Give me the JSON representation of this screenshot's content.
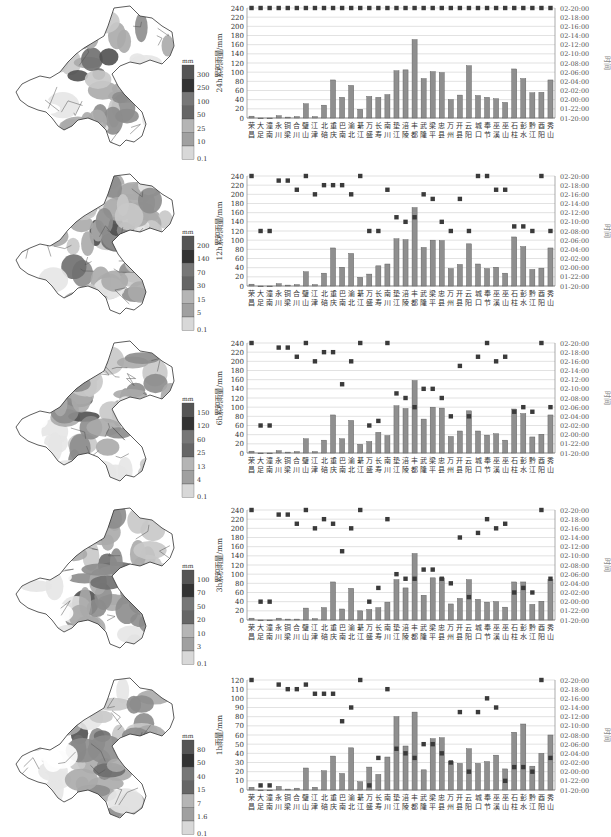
{
  "stations": [
    "荣昌",
    "大足",
    "潼南",
    "永川",
    "铜梁",
    "合川",
    "璧山",
    "江津",
    "北碚",
    "重庆",
    "巴南",
    "渝北",
    "綦江",
    "万盛",
    "长寿",
    "南川",
    "垫江",
    "涪陵",
    "丰都",
    "武隆",
    "梁平",
    "忠县",
    "万州",
    "开县",
    "云阳",
    "城口",
    "奉节",
    "巫溪",
    "巫山",
    "石柱",
    "彭水",
    "黔江",
    "酉阳",
    "秀山"
  ],
  "time_axis": {
    "label": "时间",
    "ticks": [
      "01-20:00",
      "01-22:00",
      "02-00:00",
      "02-02:00",
      "02-04:00",
      "02-06:00",
      "02-08:00",
      "02-10:00",
      "02-12:00",
      "02-14:00",
      "02-16:00",
      "02-18:00",
      "02-20:00"
    ]
  },
  "panels": [
    {
      "id": "24h",
      "legend": {
        "unit": "mm",
        "labels": [
          "300",
          "250",
          "100",
          "50",
          "25",
          "10",
          "0.1"
        ]
      },
      "chart": {
        "ylabel": "24h累积雨量/mm",
        "ymax": 240,
        "yticks": [
          0,
          20,
          40,
          60,
          80,
          100,
          120,
          140,
          160,
          180,
          200,
          220,
          240
        ]
      }
    },
    {
      "id": "12h",
      "legend": {
        "unit": "mm",
        "labels": [
          "200",
          "140",
          "70",
          "30",
          "15",
          "5",
          "0.1"
        ]
      },
      "chart": {
        "ylabel": "12h累积雨量/mm",
        "ymax": 240,
        "yticks": [
          0,
          20,
          40,
          60,
          80,
          100,
          120,
          140,
          160,
          180,
          200,
          220,
          240
        ]
      }
    },
    {
      "id": "6h",
      "legend": {
        "unit": "mm",
        "labels": [
          "150",
          "120",
          "60",
          "25",
          "13",
          "4",
          "0.1"
        ]
      },
      "chart": {
        "ylabel": "6h累积雨量/mm",
        "ymax": 240,
        "yticks": [
          0,
          20,
          40,
          60,
          80,
          100,
          120,
          140,
          160,
          180,
          200,
          220,
          240
        ]
      }
    },
    {
      "id": "3h",
      "legend": {
        "unit": "mm",
        "labels": [
          "100",
          "70",
          "50",
          "20",
          "10",
          "3",
          "0.1"
        ]
      },
      "chart": {
        "ylabel": "3h累积雨量/mm",
        "ymax": 240,
        "yticks": [
          0,
          20,
          40,
          60,
          80,
          100,
          120,
          140,
          160,
          180,
          200,
          220,
          240
        ]
      }
    },
    {
      "id": "1h",
      "legend": {
        "unit": "mm",
        "labels": [
          "80",
          "50",
          "40",
          "15",
          "7",
          "1.6",
          "0.1"
        ]
      },
      "chart": {
        "ylabel": "1h雨量/mm",
        "ymax": 120,
        "yticks": [
          0,
          10,
          20,
          30,
          40,
          50,
          60,
          70,
          80,
          90,
          100,
          110,
          120
        ]
      }
    }
  ],
  "chart_data": [
    {
      "type": "bar",
      "title": "24h累积雨量",
      "ylabel": "24h累积雨量/mm",
      "y2label": "时间",
      "ylim": [
        0,
        240
      ],
      "categories": [
        "荣昌",
        "大足",
        "潼南",
        "永川",
        "铜梁",
        "合川",
        "璧山",
        "江津",
        "北碚",
        "重庆",
        "巴南",
        "渝北",
        "綦江",
        "万盛",
        "长寿",
        "南川",
        "垫江",
        "涪陵",
        "丰都",
        "武隆",
        "梁平",
        "忠县",
        "万州",
        "开县",
        "云阳",
        "城口",
        "奉节",
        "巫溪",
        "巫山",
        "石柱",
        "彭水",
        "黔江",
        "酉阳",
        "秀山"
      ],
      "series": [
        {
          "name": "累积雨量",
          "type": "bar",
          "values": [
            4,
            0,
            0,
            5,
            2,
            3,
            31,
            3,
            28,
            83,
            45,
            71,
            19,
            47,
            45,
            51,
            103,
            105,
            171,
            86,
            101,
            99,
            40,
            50,
            114,
            49,
            45,
            42,
            34,
            107,
            86,
            55,
            56,
            83
          ]
        },
        {
          "name": "出现时间",
          "type": "scatter",
          "axis": "right",
          "values": [
            "02-20:00",
            "02-20:00",
            "02-20:00",
            "02-20:00",
            "02-20:00",
            "02-20:00",
            "02-20:00",
            "02-20:00",
            "02-20:00",
            "02-20:00",
            "02-20:00",
            "02-20:00",
            "02-20:00",
            "02-20:00",
            "02-20:00",
            "02-20:00",
            "02-20:00",
            "02-20:00",
            "02-20:00",
            "02-20:00",
            "02-20:00",
            "02-20:00",
            "02-20:00",
            "02-20:00",
            "02-20:00",
            "02-20:00",
            "02-20:00",
            "02-20:00",
            "02-20:00",
            "02-20:00",
            "02-20:00",
            "02-20:00",
            "02-20:00",
            "02-20:00"
          ]
        }
      ],
      "grid": true
    },
    {
      "type": "bar",
      "title": "12h累积雨量",
      "ylabel": "12h累积雨量/mm",
      "y2label": "时间",
      "ylim": [
        0,
        240
      ],
      "categories": [
        "荣昌",
        "大足",
        "潼南",
        "永川",
        "铜梁",
        "合川",
        "璧山",
        "江津",
        "北碚",
        "重庆",
        "巴南",
        "渝北",
        "綦江",
        "万盛",
        "长寿",
        "南川",
        "垫江",
        "涪陵",
        "丰都",
        "武隆",
        "梁平",
        "忠县",
        "万州",
        "开县",
        "云阳",
        "城口",
        "奉节",
        "巫溪",
        "巫山",
        "石柱",
        "彭水",
        "黔江",
        "酉阳",
        "秀山"
      ],
      "series": [
        {
          "name": "累积雨量",
          "type": "bar",
          "values": [
            4,
            0,
            0,
            5,
            2,
            3,
            31,
            3,
            28,
            83,
            41,
            71,
            19,
            26,
            44,
            48,
            103,
            101,
            171,
            84,
            100,
            99,
            38,
            47,
            92,
            48,
            38,
            41,
            28,
            107,
            86,
            36,
            39,
            83
          ]
        },
        {
          "name": "出现时间",
          "type": "scatter",
          "axis": "right",
          "values": [
            "02-20:00",
            "02-08:00",
            "02-08:00",
            "02-19:00",
            "02-19:00",
            "02-17:00",
            "02-20:00",
            "02-16:00",
            "02-18:00",
            "02-18:00",
            "02-18:00",
            "02-16:00",
            "02-20:00",
            "02-08:00",
            "02-08:00",
            "02-17:00",
            "02-11:00",
            "02-10:00",
            "02-11:00",
            "02-16:00",
            "02-15:00",
            "02-10:00",
            "02-08:00",
            "02-15:00",
            "02-08:00",
            "02-20:00",
            "02-20:00",
            "02-17:00",
            "02-17:00",
            "02-09:00",
            "02-09:00",
            "02-08:00",
            "02-20:00",
            "02-08:00"
          ]
        }
      ],
      "grid": true
    },
    {
      "type": "bar",
      "title": "6h累积雨量",
      "ylabel": "6h累积雨量/mm",
      "y2label": "时间",
      "ylim": [
        0,
        240
      ],
      "categories": [
        "荣昌",
        "大足",
        "潼南",
        "永川",
        "铜梁",
        "合川",
        "璧山",
        "江津",
        "北碚",
        "重庆",
        "巴南",
        "渝北",
        "綦江",
        "万盛",
        "长寿",
        "南川",
        "垫江",
        "涪陵",
        "丰都",
        "武隆",
        "梁平",
        "忠县",
        "万州",
        "开县",
        "云阳",
        "城口",
        "奉节",
        "巫溪",
        "巫山",
        "石柱",
        "彭水",
        "黔江",
        "酉阳",
        "秀山"
      ],
      "series": [
        {
          "name": "累积雨量",
          "type": "bar",
          "values": [
            4,
            0,
            0,
            5,
            2,
            3,
            31,
            3,
            28,
            83,
            31,
            71,
            19,
            25,
            45,
            38,
            103,
            97,
            158,
            74,
            100,
            98,
            36,
            48,
            92,
            48,
            39,
            42,
            28,
            96,
            86,
            35,
            41,
            83
          ]
        },
        {
          "name": "出现时间",
          "type": "scatter",
          "axis": "right",
          "values": [
            "02-20:00",
            "02-02:00",
            "02-02:00",
            "02-19:00",
            "02-19:00",
            "02-17:00",
            "02-20:00",
            "02-16:00",
            "02-18:00",
            "02-18:00",
            "02-11:00",
            "02-16:00",
            "02-20:00",
            "02-02:00",
            "02-03:00",
            "02-20:00",
            "02-09:00",
            "02-08:00",
            "02-06:00",
            "02-10:00",
            "02-10:00",
            "02-08:00",
            "02-04:00",
            "02-15:00",
            "02-04:00",
            "02-17:00",
            "02-20:00",
            "02-16:00",
            "02-17:00",
            "02-05:00",
            "02-06:00",
            "02-05:00",
            "02-20:00",
            "02-06:00"
          ]
        }
      ],
      "grid": true
    },
    {
      "type": "bar",
      "title": "3h累积雨量",
      "ylabel": "3h累积雨量/mm",
      "y2label": "时间",
      "ylim": [
        0,
        240
      ],
      "categories": [
        "荣昌",
        "大足",
        "潼南",
        "永川",
        "铜梁",
        "合川",
        "璧山",
        "江津",
        "北碚",
        "重庆",
        "巴南",
        "渝北",
        "綦江",
        "万盛",
        "长寿",
        "南川",
        "垫江",
        "涪陵",
        "丰都",
        "武隆",
        "梁平",
        "忠县",
        "万州",
        "开县",
        "云阳",
        "城口",
        "奉节",
        "巫溪",
        "巫山",
        "石柱",
        "彭水",
        "黔江",
        "酉阳",
        "秀山"
      ],
      "series": [
        {
          "name": "累积雨量",
          "type": "bar",
          "values": [
            4,
            0,
            0,
            4,
            2,
            2,
            26,
            3,
            27,
            83,
            24,
            69,
            20,
            23,
            27,
            39,
            88,
            70,
            145,
            54,
            92,
            92,
            35,
            47,
            88,
            45,
            39,
            40,
            28,
            83,
            83,
            34,
            41,
            88
          ]
        },
        {
          "name": "出现时间",
          "type": "scatter",
          "axis": "right",
          "values": [
            "02-20:00",
            "02-00:00",
            "02-00:00",
            "02-19:00",
            "02-19:00",
            "02-17:00",
            "02-20:00",
            "02-16:00",
            "02-18:00",
            "02-17:00",
            "02-11:00",
            "02-16:00",
            "02-20:00",
            "02-00:00",
            "02-03:00",
            "02-18:00",
            "02-06:00",
            "02-05:00",
            "02-05:00",
            "02-07:00",
            "02-07:00",
            "02-05:00",
            "02-04:00",
            "02-14:00",
            "02-01:00",
            "02-15:00",
            "02-18:00",
            "02-16:00",
            "02-17:00",
            "02-02:00",
            "02-03:00",
            "02-02:00",
            "02-20:00",
            "02-05:00"
          ]
        }
      ],
      "grid": true
    },
    {
      "type": "bar",
      "title": "1h雨量",
      "ylabel": "1h雨量/mm",
      "y2label": "时间",
      "ylim": [
        0,
        120
      ],
      "categories": [
        "荣昌",
        "大足",
        "潼南",
        "永川",
        "铜梁",
        "合川",
        "璧山",
        "江津",
        "北碚",
        "重庆",
        "巴南",
        "渝北",
        "綦江",
        "万盛",
        "长寿",
        "南川",
        "垫江",
        "涪陵",
        "丰都",
        "武隆",
        "梁平",
        "忠县",
        "万州",
        "开县",
        "云阳",
        "城口",
        "奉节",
        "巫溪",
        "巫山",
        "石柱",
        "彭水",
        "黔江",
        "酉阳",
        "秀山"
      ],
      "series": [
        {
          "name": "雨量",
          "type": "bar",
          "values": [
            3,
            0,
            0,
            4,
            1,
            2,
            24,
            3,
            21,
            37,
            18,
            46,
            9,
            25,
            17,
            36,
            80,
            48,
            85,
            22,
            56,
            57,
            31,
            29,
            45,
            29,
            31,
            38,
            23,
            63,
            72,
            26,
            40,
            60
          ]
        },
        {
          "name": "出现时间",
          "type": "scatter",
          "axis": "right",
          "values": [
            "02-20:00",
            "01-21:00",
            "01-21:00",
            "02-19:00",
            "02-18:00",
            "02-18:00",
            "02-19:00",
            "02-17:00",
            "02-17:00",
            "02-17:00",
            "02-11:00",
            "02-14:00",
            "02-20:00",
            "01-21:00",
            "02-03:00",
            "02-18:00",
            "02-05:00",
            "02-04:00",
            "02-03:00",
            "02-06:00",
            "02-06:00",
            "02-04:00",
            "02-02:00",
            "02-13:00",
            "02-00:00",
            "02-13:00",
            "02-16:00",
            "02-14:00",
            "01-22:00",
            "02-01:00",
            "02-01:00",
            "02-00:00",
            "02-20:00",
            "02-03:00"
          ]
        }
      ],
      "grid": true
    }
  ]
}
